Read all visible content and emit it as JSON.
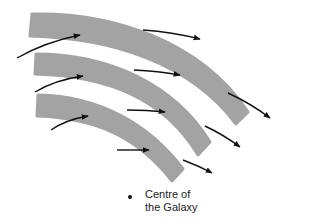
{
  "diagram": {
    "colors": {
      "band": "#a3a3a3",
      "arrow": "#111111",
      "background": "#ffffff"
    },
    "bands": [
      {
        "id": "band-outer",
        "path": "M32 14 C 110 12, 200 40, 248 112 L 236 124 C 190 62, 110 38, 30 36 Z"
      },
      {
        "id": "band-middle",
        "path": "M36 54 C 110 54, 175 85, 210 142 L 198 155 C 165 100, 110 76, 35 74 Z"
      },
      {
        "id": "band-inner",
        "path": "M38 95 C 100 96, 150 125, 183 169 L 172 181 C 140 140, 100 118, 37 116 Z"
      }
    ],
    "arrows": [
      {
        "id": "arrow-left-1",
        "path": "M17 58 Q 45 42, 80 35"
      },
      {
        "id": "arrow-left-2",
        "path": "M35 92 Q 55 80, 83 76"
      },
      {
        "id": "arrow-left-3",
        "path": "M51 130 Q 65 120, 88 116"
      },
      {
        "id": "arrow-mid-1",
        "path": "M143 30 Q 172 32, 200 39"
      },
      {
        "id": "arrow-mid-2",
        "path": "M134 70 Q 158 71, 180 75"
      },
      {
        "id": "arrow-mid-3",
        "path": "M127 110 Q 147 110, 165 112"
      },
      {
        "id": "arrow-bottom",
        "path": "M117 150 Q 133 150, 149 150"
      },
      {
        "id": "arrow-right-1",
        "path": "M228 93 Q 250 103, 270 118"
      },
      {
        "id": "arrow-right-2",
        "path": "M205 126 Q 224 135, 240 147"
      },
      {
        "id": "arrow-right-3",
        "path": "M183 160 Q 199 166, 212 173"
      }
    ],
    "center_label": {
      "line1": "Centre of",
      "line2": "the Galaxy"
    }
  }
}
